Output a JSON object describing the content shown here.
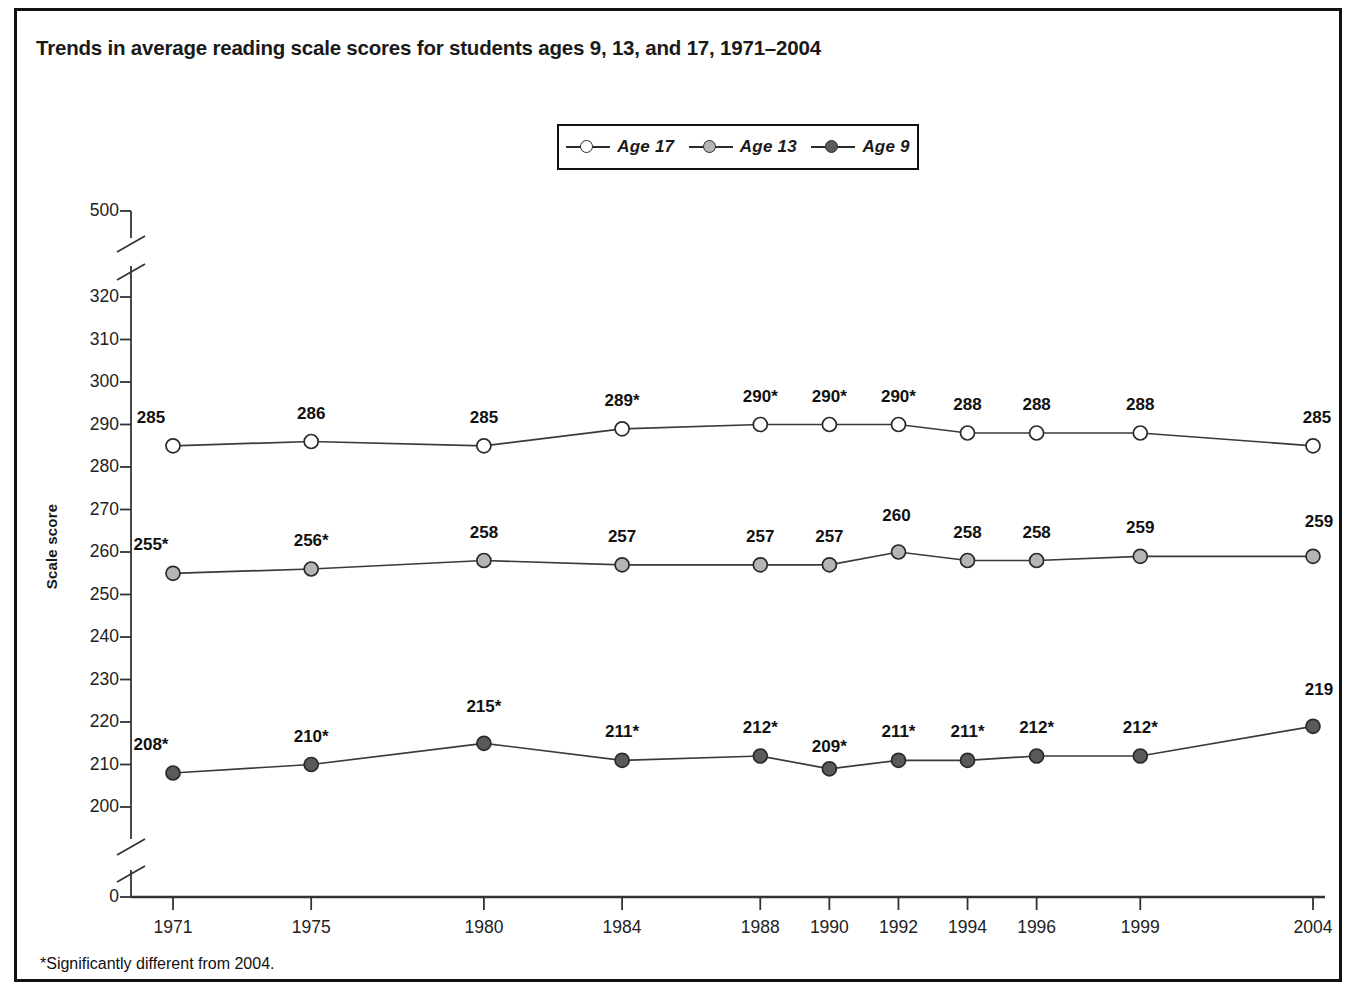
{
  "title": "Trends in average reading scale scores for students ages 9, 13, and 17, 1971–2004",
  "footnote": "*Significantly different from 2004.",
  "y_axis_label": "Scale score",
  "legend": {
    "items": [
      {
        "label": "Age 17",
        "marker": "hollow-circle",
        "color": "#ffffff"
      },
      {
        "label": "Age 13",
        "marker": "light-gray-circle",
        "color": "#b5b5b5"
      },
      {
        "label": "Age 9",
        "marker": "dark-gray-circle",
        "color": "#5a5a5a"
      }
    ]
  },
  "chart_data": {
    "type": "line",
    "title": "Trends in average reading scale scores for students ages 9, 13, and 17, 1971–2004",
    "xlabel": "",
    "ylabel": "Scale score",
    "x": [
      1971,
      1975,
      1980,
      1984,
      1988,
      1990,
      1992,
      1994,
      1996,
      1999,
      2004
    ],
    "xticklabels": [
      "1971",
      "1975",
      "1980",
      "1984",
      "1988",
      "1990",
      "1992",
      "1994",
      "1996",
      "1999",
      "2004"
    ],
    "yticklabels": [
      "500",
      "320",
      "310",
      "300",
      "290",
      "280",
      "270",
      "260",
      "250",
      "240",
      "230",
      "220",
      "210",
      "200",
      "0"
    ],
    "ylim": [
      200,
      320
    ],
    "y_axis_breaks": [
      "between 500 and 320",
      "between 200 and 0"
    ],
    "grid": false,
    "legend_position": "top-center",
    "series": [
      {
        "name": "Age 17",
        "color": "#ffffff",
        "values": [
          285,
          286,
          285,
          289,
          290,
          290,
          290,
          288,
          288,
          288,
          285
        ],
        "labels": [
          "285",
          "286",
          "285",
          "289*",
          "290*",
          "290*",
          "290*",
          "288",
          "288",
          "288",
          "285"
        ],
        "significant": [
          false,
          false,
          false,
          true,
          true,
          true,
          true,
          false,
          false,
          false,
          false
        ]
      },
      {
        "name": "Age 13",
        "color": "#b5b5b5",
        "values": [
          255,
          256,
          258,
          257,
          257,
          257,
          260,
          258,
          258,
          259,
          259
        ],
        "labels": [
          "255*",
          "256*",
          "258",
          "257",
          "257",
          "257",
          "260",
          "258",
          "258",
          "259",
          "259"
        ],
        "significant": [
          true,
          true,
          false,
          false,
          false,
          false,
          false,
          false,
          false,
          false,
          false
        ]
      },
      {
        "name": "Age 9",
        "color": "#5a5a5a",
        "values": [
          208,
          210,
          215,
          211,
          212,
          209,
          211,
          211,
          212,
          212,
          219
        ],
        "labels": [
          "208*",
          "210*",
          "215*",
          "211*",
          "212*",
          "209*",
          "211*",
          "211*",
          "212*",
          "212*",
          "219"
        ],
        "significant": [
          true,
          true,
          true,
          true,
          true,
          true,
          true,
          true,
          true,
          true,
          false
        ]
      }
    ]
  }
}
